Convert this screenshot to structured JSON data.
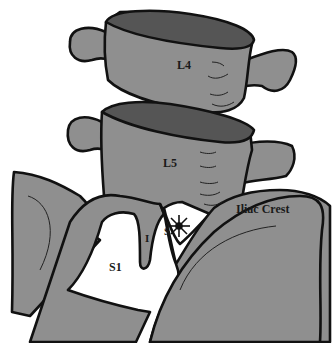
{
  "diagram": {
    "colors": {
      "bone_fill": "#8f8f8f",
      "endplate_fill": "#555555",
      "outline": "#111111",
      "background": "#ffffff",
      "foramen_fill": "#ffffff"
    },
    "labels": {
      "l4": "L4",
      "l5": "L5",
      "s1": "S1",
      "inferior": "I",
      "superior": "S",
      "iliac_crest": "Iliac Crest"
    },
    "markers": {
      "star": "star-marker"
    }
  }
}
